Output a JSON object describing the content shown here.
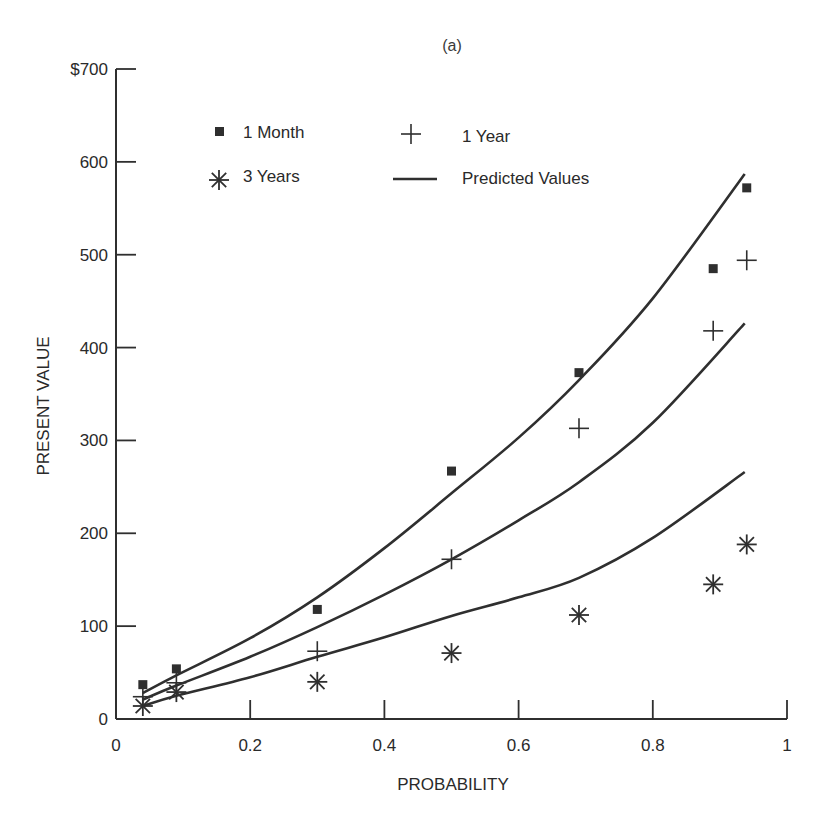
{
  "chart_data": {
    "type": "scatter",
    "title": "(a)",
    "xlabel": "PROBABILITY",
    "ylabel": "PRESENT VALUE",
    "xlim": [
      0,
      1
    ],
    "ylim": [
      0,
      700
    ],
    "x_ticks": [
      0,
      0.2,
      0.4,
      0.6,
      0.8,
      1
    ],
    "x_tick_labels": [
      "0",
      "0.2",
      "0.4",
      "0.6",
      "0.8",
      "1"
    ],
    "y_ticks": [
      0,
      100,
      200,
      300,
      400,
      500,
      600,
      700
    ],
    "y_tick_labels": [
      "0",
      "100",
      "200",
      "300",
      "400",
      "500",
      "600",
      "$700"
    ],
    "grid": false,
    "legend_position": "upper left (inside)",
    "series": [
      {
        "name": "1 Month",
        "marker": "square",
        "x": [
          0.04,
          0.09,
          0.3,
          0.5,
          0.69,
          0.89,
          0.94
        ],
        "values": [
          37,
          54,
          118,
          267,
          373,
          485,
          572
        ]
      },
      {
        "name": "1 Year",
        "marker": "plus",
        "x": [
          0.04,
          0.09,
          0.3,
          0.5,
          0.69,
          0.89,
          0.94
        ],
        "values": [
          24,
          39,
          73,
          172,
          313,
          418,
          494
        ]
      },
      {
        "name": "3 Years",
        "marker": "asterisk",
        "x": [
          0.04,
          0.09,
          0.3,
          0.5,
          0.69,
          0.89,
          0.94
        ],
        "values": [
          14,
          29,
          40,
          71,
          112,
          145,
          188
        ]
      }
    ],
    "predicted_curves": [
      {
        "name": "Predicted Values (1 Month)",
        "x": [
          0.04,
          0.09,
          0.2,
          0.3,
          0.4,
          0.5,
          0.6,
          0.69,
          0.8,
          0.937
        ],
        "values": [
          28,
          47,
          87,
          131,
          184,
          243,
          303,
          365,
          453,
          587
        ]
      },
      {
        "name": "Predicted Values (1 Year)",
        "x": [
          0.04,
          0.09,
          0.2,
          0.3,
          0.4,
          0.5,
          0.6,
          0.69,
          0.8,
          0.937
        ],
        "values": [
          21,
          36,
          67,
          99,
          134,
          172,
          214,
          255,
          319,
          426
        ]
      },
      {
        "name": "Predicted Values (3 Years)",
        "x": [
          0.04,
          0.09,
          0.2,
          0.3,
          0.4,
          0.5,
          0.6,
          0.69,
          0.8,
          0.937
        ],
        "values": [
          14,
          25,
          45,
          67,
          88,
          111,
          131,
          152,
          195,
          266
        ]
      }
    ],
    "legend": [
      {
        "label": "1 Month",
        "symbol": "square"
      },
      {
        "label": "1 Year",
        "symbol": "plus"
      },
      {
        "label": "3 Years",
        "symbol": "asterisk"
      },
      {
        "label": "Predicted Values",
        "symbol": "line"
      }
    ]
  },
  "colors": {
    "ink": "#2f2f2f",
    "background": "#ffffff"
  }
}
